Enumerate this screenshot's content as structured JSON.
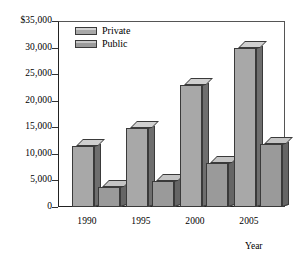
{
  "chart_data": {
    "type": "bar",
    "title": "",
    "subtitle": "",
    "xlabel": "Year",
    "ylabel": "",
    "categories": [
      "1990",
      "1995",
      "2000",
      "2005"
    ],
    "series": [
      {
        "name": "Private",
        "values": [
          11500,
          14800,
          23000,
          30000
        ],
        "color": "#a8a8a8"
      },
      {
        "name": "Public",
        "values": [
          3700,
          4900,
          8200,
          11800
        ],
        "color": "#9a9a9a"
      }
    ],
    "ylim": [
      0,
      35000
    ],
    "ytick_values": [
      35000,
      30000,
      25000,
      20000,
      15000,
      10000,
      5000,
      0
    ],
    "ytick_labels": [
      "$35,000",
      "30,000",
      "25,000",
      "20,000",
      "15,000",
      "10,000",
      "5,000",
      "0"
    ],
    "grid": false,
    "legend_position": "top-left",
    "style": "3d-bars",
    "annotations": []
  },
  "axis": {
    "y_labels": [
      "$35,000",
      "30,000",
      "25,000",
      "20,000",
      "15,000",
      "10,000",
      "5,000",
      "0"
    ],
    "x_labels": [
      "1990",
      "1995",
      "2000",
      "2005"
    ],
    "x_title": "Year"
  },
  "legend": {
    "items": [
      {
        "label": "Private"
      },
      {
        "label": "Public"
      }
    ]
  }
}
